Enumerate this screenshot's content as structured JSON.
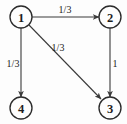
{
  "diagram": {
    "type": "directed-graph",
    "title": "",
    "background_color": "#fdfdfd",
    "stroke_color": "#3a3a3a",
    "label_color": "#1d1d1d",
    "nodes": [
      {
        "id": "1",
        "label": "1",
        "cx": 21,
        "cy": 17,
        "r": 11
      },
      {
        "id": "2",
        "label": "2",
        "cx": 110,
        "cy": 17,
        "r": 11
      },
      {
        "id": "3",
        "label": "3",
        "cx": 110,
        "cy": 108,
        "r": 11
      },
      {
        "id": "4",
        "label": "4",
        "cx": 21,
        "cy": 108,
        "r": 11
      }
    ],
    "edges": [
      {
        "id": "e1",
        "from": "1",
        "to": "2",
        "label": "1/3",
        "label_x": 65,
        "label_y": 9,
        "x1": 32,
        "y1": 17,
        "x2": 99,
        "y2": 17
      },
      {
        "id": "e2",
        "from": "1",
        "to": "4",
        "label": "1/3",
        "label_x": 13,
        "label_y": 63,
        "x1": 21,
        "y1": 28,
        "x2": 21,
        "y2": 97
      },
      {
        "id": "e3",
        "from": "1",
        "to": "3",
        "label": "1/3",
        "label_x": 58,
        "label_y": 47,
        "x1": 29,
        "y1": 25,
        "x2": 102,
        "y2": 100
      },
      {
        "id": "e4",
        "from": "2",
        "to": "3",
        "label": "1",
        "label_x": 115,
        "label_y": 63,
        "x1": 110,
        "y1": 28,
        "x2": 110,
        "y2": 97
      }
    ]
  }
}
